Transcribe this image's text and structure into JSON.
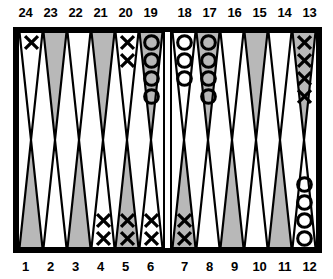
{
  "game": {
    "name": "backgammon-board",
    "colors": {
      "border": "#000000",
      "point_light": "#ffffff",
      "point_dark": "#b8b8b8",
      "checker_x": "#000000",
      "checker_o": "#000000",
      "background": "#ffffff"
    },
    "top_labels": [
      "24",
      "23",
      "22",
      "21",
      "20",
      "19",
      "18",
      "17",
      "16",
      "15",
      "14",
      "13"
    ],
    "bottom_labels": [
      "1",
      "2",
      "3",
      "4",
      "5",
      "6",
      "7",
      "8",
      "9",
      "10",
      "11",
      "12"
    ],
    "bar": {
      "x_checkers": 0,
      "o_checkers": 0
    },
    "points": {
      "top_left": [
        {
          "label": "24",
          "shade": "light",
          "checker": "X",
          "count": 1
        },
        {
          "label": "23",
          "shade": "dark",
          "checker": null,
          "count": 0
        },
        {
          "label": "22",
          "shade": "light",
          "checker": null,
          "count": 0
        },
        {
          "label": "21",
          "shade": "dark",
          "checker": null,
          "count": 0
        },
        {
          "label": "20",
          "shade": "light",
          "checker": "X",
          "count": 2
        },
        {
          "label": "19",
          "shade": "dark",
          "checker": "O",
          "count": 4
        }
      ],
      "top_right": [
        {
          "label": "18",
          "shade": "light",
          "checker": "O",
          "count": 3
        },
        {
          "label": "17",
          "shade": "dark",
          "checker": "O",
          "count": 4
        },
        {
          "label": "16",
          "shade": "light",
          "checker": null,
          "count": 0
        },
        {
          "label": "15",
          "shade": "dark",
          "checker": null,
          "count": 0
        },
        {
          "label": "14",
          "shade": "light",
          "checker": null,
          "count": 0
        },
        {
          "label": "13",
          "shade": "dark",
          "checker": "X",
          "count": 4
        }
      ],
      "bottom_left": [
        {
          "label": "1",
          "shade": "dark",
          "checker": null,
          "count": 0
        },
        {
          "label": "2",
          "shade": "light",
          "checker": null,
          "count": 0
        },
        {
          "label": "3",
          "shade": "dark",
          "checker": null,
          "count": 0
        },
        {
          "label": "4",
          "shade": "light",
          "checker": "X",
          "count": 2
        },
        {
          "label": "5",
          "shade": "dark",
          "checker": "X",
          "count": 2
        },
        {
          "label": "6",
          "shade": "light",
          "checker": "X",
          "count": 2
        }
      ],
      "bottom_right": [
        {
          "label": "7",
          "shade": "dark",
          "checker": "X",
          "count": 2
        },
        {
          "label": "8",
          "shade": "light",
          "checker": null,
          "count": 0
        },
        {
          "label": "9",
          "shade": "dark",
          "checker": null,
          "count": 0
        },
        {
          "label": "10",
          "shade": "light",
          "checker": null,
          "count": 0
        },
        {
          "label": "11",
          "shade": "dark",
          "checker": null,
          "count": 0
        },
        {
          "label": "12",
          "shade": "light",
          "checker": "O",
          "count": 4
        }
      ]
    }
  }
}
